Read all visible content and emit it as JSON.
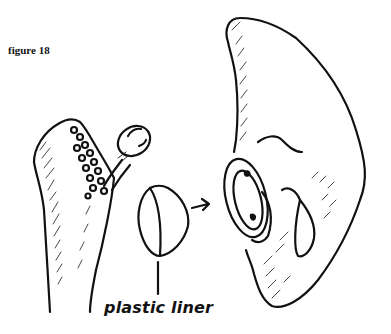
{
  "figure": {
    "label": "figure 18",
    "callouts": [
      {
        "text": "plastic liner",
        "points_to": "acetabular-liner"
      }
    ],
    "parts": [
      {
        "id": "femur",
        "description": "femur with femoral stem prosthesis and ball head"
      },
      {
        "id": "acetabular-liner",
        "description": "hemispherical plastic liner"
      },
      {
        "id": "pelvis",
        "description": "pelvis with acetabular cup implant"
      }
    ],
    "arrow": {
      "from": "acetabular-liner",
      "to": "pelvis"
    },
    "colors": {
      "ink": "#111111",
      "background": "#ffffff"
    }
  }
}
